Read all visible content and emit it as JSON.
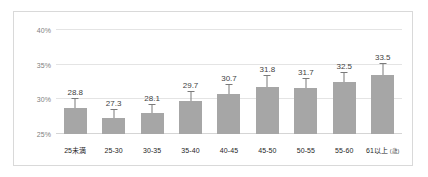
{
  "chart_data": {
    "type": "bar",
    "title": "",
    "subtitle": "",
    "xlabel": "",
    "ylabel": "",
    "unit_note": "(歳)",
    "categories": [
      "25未満",
      "25-30",
      "30-35",
      "35-40",
      "40-45",
      "45-50",
      "50-55",
      "55-60",
      "61以上"
    ],
    "values": [
      28.8,
      27.3,
      28.1,
      29.7,
      30.7,
      31.8,
      31.7,
      32.5,
      33.5
    ],
    "data_labels": [
      "28.8",
      "27.3",
      "28.1",
      "29.7",
      "30.7",
      "31.8",
      "31.7",
      "32.5",
      "33.5"
    ],
    "error_bars": {
      "present": true,
      "upper": [
        1.3,
        1.1,
        1.1,
        1.3,
        1.4,
        1.5,
        1.2,
        1.3,
        1.6
      ],
      "lower": [
        1.3,
        1.1,
        1.1,
        1.3,
        1.4,
        1.5,
        1.2,
        1.3,
        1.6
      ]
    },
    "ylim": [
      25,
      41
    ],
    "yticks": [
      25,
      30,
      35,
      40
    ],
    "ytick_labels": [
      "25%",
      "30%",
      "35%",
      "40%"
    ],
    "grid": true,
    "legend": "none",
    "series": [
      {
        "name": "",
        "values": [
          28.8,
          27.3,
          28.1,
          29.7,
          30.7,
          31.8,
          31.7,
          32.5,
          33.5
        ]
      }
    ],
    "colors": {
      "bar": "#a6a6a6",
      "error_bar": "#7a7a7a",
      "gridline": "#e4e4e4",
      "baseline": "#d5d5d5",
      "ytick_text": "#808080",
      "xtick_text": "#262626",
      "data_label_text": "#3f3f3f",
      "frame_border": "#d9d9d9",
      "background": "#ffffff"
    }
  }
}
